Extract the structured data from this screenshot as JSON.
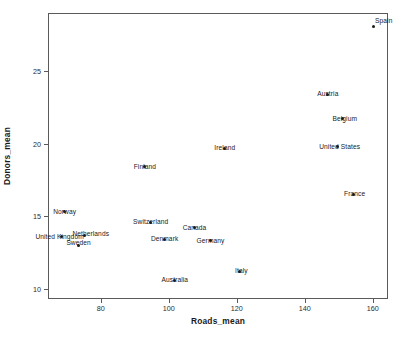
{
  "chart_data": {
    "type": "scatter",
    "title": "",
    "xlabel": "Roads_mean",
    "ylabel": "Donors_mean",
    "xlim": [
      64.5,
      164.5
    ],
    "ylim": [
      9.3,
      29.0
    ],
    "xticks": [
      80,
      100,
      120,
      140,
      160
    ],
    "xtick_labels": [
      "80",
      "100",
      "120",
      "140",
      "160"
    ],
    "yticks": [
      10,
      15,
      20,
      25
    ],
    "ytick_labels": [
      "10",
      "15",
      "20",
      "25"
    ],
    "grid": false,
    "legend": false,
    "point_labels": true,
    "marker_color": "#1a1a1a",
    "frame_color": "#5a5a5a",
    "points": [
      {
        "label": "Spain",
        "x": 160.3,
        "y": 28.1,
        "label_dx": 10,
        "label_dy": -0.5
      },
      {
        "label": "Austria",
        "x": 146.8,
        "y": 23.4,
        "label_dx": 0,
        "label_dy": 0
      },
      {
        "label": "Belgium",
        "x": 151.2,
        "y": 21.7,
        "label_dx": 2,
        "label_dy": 0
      },
      {
        "label": "United States",
        "x": 149.7,
        "y": 19.8,
        "label_dx": 2,
        "label_dy": 0
      },
      {
        "label": "Ireland",
        "x": 116.5,
        "y": 19.7,
        "label_dx": 0,
        "label_dy": 0
      },
      {
        "label": "Finland",
        "x": 93.0,
        "y": 18.4,
        "label_dx": 0,
        "label_dy": 0
      },
      {
        "label": "France",
        "x": 154.4,
        "y": 16.5,
        "label_dx": 1,
        "label_dy": 0
      },
      {
        "label": "Norway",
        "x": 69.4,
        "y": 15.3,
        "label_dx": 0,
        "label_dy": 0
      },
      {
        "label": "Switzerland",
        "x": 94.7,
        "y": 14.6,
        "label_dx": 0,
        "label_dy": 0
      },
      {
        "label": "Canada",
        "x": 107.6,
        "y": 14.2,
        "label_dx": 0,
        "label_dy": 0
      },
      {
        "label": "United Kingdom",
        "x": 68.5,
        "y": 13.6,
        "label_dx": -2,
        "label_dy": 0
      },
      {
        "label": "Netherlands",
        "x": 75.3,
        "y": 13.7,
        "label_dx": 6,
        "label_dy": -0.1
      },
      {
        "label": "Sweden",
        "x": 73.5,
        "y": 13.0,
        "label_dx": 0,
        "label_dy": -0.25
      },
      {
        "label": "Denmark",
        "x": 98.8,
        "y": 13.4,
        "label_dx": 0,
        "label_dy": 0
      },
      {
        "label": "Germany",
        "x": 112.3,
        "y": 13.3,
        "label_dx": 0,
        "label_dy": 0
      },
      {
        "label": "Italy",
        "x": 120.8,
        "y": 11.2,
        "label_dx": 2,
        "label_dy": 0
      },
      {
        "label": "Australia",
        "x": 101.8,
        "y": 10.6,
        "label_dx": 0,
        "label_dy": 0
      }
    ]
  }
}
